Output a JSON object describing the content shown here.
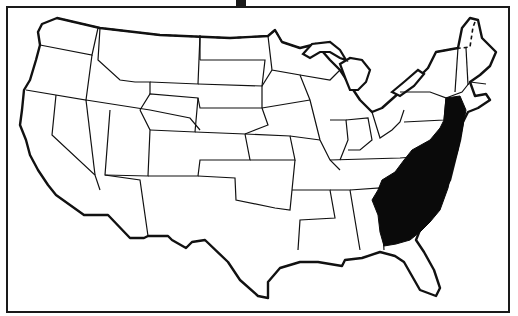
{
  "map": {
    "type": "choropleth-outline",
    "subject": "United States (contiguous 48 states)",
    "style": "black-and-white line drawing",
    "highlighted_region": {
      "fill_color": "#0a0a0a",
      "states": [
        "New Jersey",
        "Delaware",
        "Maryland",
        "Virginia",
        "North Carolina",
        "South Carolina",
        "Georgia"
      ]
    },
    "base_fill": "#ffffff",
    "outline_color": "#111111"
  }
}
